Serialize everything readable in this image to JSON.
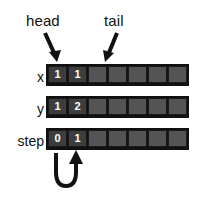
{
  "diagram": {
    "background_color": "#ffffff",
    "annotations": [
      {
        "id": "head",
        "label": "head",
        "points_to_row": "x",
        "points_to_index": 0
      },
      {
        "id": "tail",
        "label": "tail",
        "points_to_row": "x",
        "points_to_index": 2
      }
    ],
    "cell_count": 7,
    "colors": {
      "filled_cell": "#3d3d3d",
      "empty_cell": "#545454",
      "cell_border": "#1a1a1a",
      "row_frame": "#111111",
      "cell_text": "#ffffff",
      "label_text": "#111111",
      "arrow": "#111111"
    },
    "rows": [
      {
        "label": "x",
        "cells": [
          "1",
          "1",
          "",
          "",
          "",
          "",
          ""
        ],
        "filled": [
          true,
          true,
          false,
          false,
          false,
          false,
          false
        ]
      },
      {
        "label": "y",
        "cells": [
          "1",
          "2",
          "",
          "",
          "",
          "",
          ""
        ],
        "filled": [
          true,
          true,
          false,
          false,
          false,
          false,
          false
        ]
      },
      {
        "label": "step",
        "cells": [
          "0",
          "1",
          "",
          "",
          "",
          "",
          ""
        ],
        "filled": [
          true,
          true,
          false,
          false,
          false,
          false,
          false
        ]
      }
    ],
    "loop_arrow": {
      "name": "step-loop-arrow",
      "from_index": 0,
      "to_index": 1,
      "description": "curved u-turn arrow from step cell 0 back up to step cell 1"
    }
  }
}
